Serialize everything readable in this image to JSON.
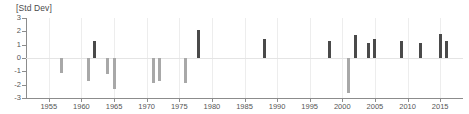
{
  "chart_data": {
    "type": "bar",
    "title": "[Std Dev]",
    "xlabel": "",
    "ylabel": "",
    "ylim": [
      -3,
      3
    ],
    "xlim": [
      1951,
      1918
    ],
    "x_range": [
      1951.5,
      1918.5
    ],
    "grid": "vertical gridlines at each 5-year tick, horizontal zero line",
    "legend": "none",
    "ytick_labels": [
      "3",
      "2",
      "1",
      "0",
      "-1",
      "-2",
      "-3"
    ],
    "ytick_values": [
      3,
      2,
      1,
      0,
      -1,
      -2,
      -3
    ],
    "xtick_labels": [
      "1955",
      "1960",
      "1965",
      "1970",
      "1975",
      "1980",
      "1985",
      "1990",
      "1995",
      "2000",
      "2005",
      "2010",
      "2015"
    ],
    "xtick_values": [
      1955,
      1960,
      1965,
      1970,
      1975,
      1980,
      1985,
      1990,
      1995,
      2000,
      2005,
      2010,
      2015
    ],
    "colors": {
      "positive_bar": "#4a4a4a",
      "negative_bar": "#a8a8a8",
      "axis": "#8c8c8c",
      "grid": "#ededed",
      "text": "#555555",
      "background": "#ffffff"
    },
    "x": [
      1957,
      1961,
      1962,
      1964,
      1965,
      1971,
      1972,
      1976,
      1978,
      1988,
      1998,
      2001,
      2002,
      2004,
      2005,
      2009,
      2012,
      2015,
      2016
    ],
    "values": [
      -1.1,
      -1.7,
      1.3,
      -1.2,
      -2.3,
      -1.9,
      -1.7,
      -1.9,
      2.1,
      1.4,
      1.3,
      -2.6,
      1.7,
      1.1,
      1.4,
      1.3,
      1.1,
      1.8,
      1.3
    ],
    "bars": [
      {
        "year": 1957,
        "value": -1.1,
        "sign": "negative"
      },
      {
        "year": 1961,
        "value": -1.7,
        "sign": "negative"
      },
      {
        "year": 1962,
        "value": 1.3,
        "sign": "positive"
      },
      {
        "year": 1964,
        "value": -1.2,
        "sign": "negative"
      },
      {
        "year": 1965,
        "value": -2.3,
        "sign": "negative"
      },
      {
        "year": 1971,
        "value": -1.9,
        "sign": "negative"
      },
      {
        "year": 1972,
        "value": -1.7,
        "sign": "negative"
      },
      {
        "year": 1976,
        "value": -1.9,
        "sign": "negative"
      },
      {
        "year": 1978,
        "value": 2.1,
        "sign": "positive"
      },
      {
        "year": 1988,
        "value": 1.4,
        "sign": "positive"
      },
      {
        "year": 1998,
        "value": 1.3,
        "sign": "positive"
      },
      {
        "year": 2001,
        "value": -2.6,
        "sign": "negative"
      },
      {
        "year": 2002,
        "value": 1.7,
        "sign": "positive"
      },
      {
        "year": 2004,
        "value": 1.1,
        "sign": "positive"
      },
      {
        "year": 2005,
        "value": 1.4,
        "sign": "positive"
      },
      {
        "year": 2009,
        "value": 1.3,
        "sign": "positive"
      },
      {
        "year": 2012,
        "value": 1.1,
        "sign": "positive"
      },
      {
        "year": 2015,
        "value": 1.8,
        "sign": "positive"
      },
      {
        "year": 2016,
        "value": 1.3,
        "sign": "positive"
      }
    ]
  }
}
